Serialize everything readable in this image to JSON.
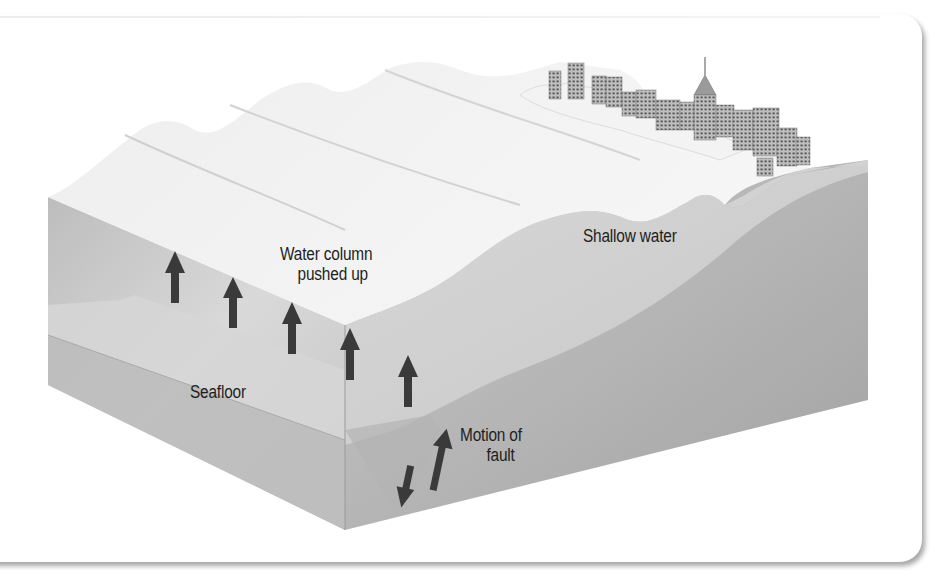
{
  "figure": {
    "labels": {
      "water_column_line1": "Water column",
      "water_column_line2": "pushed up",
      "shallow_water": "Shallow water",
      "seafloor": "Seafloor",
      "fault_line1": "Motion of",
      "fault_line2": "fault"
    },
    "elements": {
      "upward_arrows_count": 5,
      "fault_arrows": [
        "down",
        "up"
      ],
      "city_buildings": "coastal city skyline with spire tower",
      "waves": "three wave crests growing toward shore, breaking wave at coast"
    },
    "colors": {
      "water_surface": "#eeeeee",
      "block_front": "#c9c9c9",
      "block_right": "#a9a9a9",
      "arrow": "#3a3a3a",
      "text": "#1e1e1e"
    }
  }
}
